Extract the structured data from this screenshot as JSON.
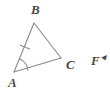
{
  "figure": {
    "type": "geometry-triangle-diagram",
    "background_color": "#ffffff",
    "stroke_color": "#8a8a8a",
    "label_color": "#4a4a4a",
    "stroke_width": 1,
    "vertices": [
      {
        "name": "A",
        "label": "A",
        "x": 14,
        "y": 72
      },
      {
        "name": "B",
        "label": "B",
        "x": 34,
        "y": 23
      },
      {
        "name": "C",
        "label": "C",
        "x": 61,
        "y": 58
      }
    ],
    "sides": [
      {
        "name": "AB",
        "from": "A",
        "to": "B",
        "tick_marks": 1
      },
      {
        "name": "BC",
        "from": "B",
        "to": "C",
        "tick_marks": 0
      },
      {
        "name": "AC",
        "from": "A",
        "to": "C",
        "tick_marks": 0
      }
    ],
    "angle_marks": [
      {
        "at_vertex": "A",
        "arcs": 1
      }
    ],
    "tick_mark": {
      "on_side": "AB",
      "x": 25,
      "y": 48
    }
  },
  "annotation": {
    "text": "F",
    "cut_glyph": "◂",
    "x": 91,
    "y": 51
  }
}
